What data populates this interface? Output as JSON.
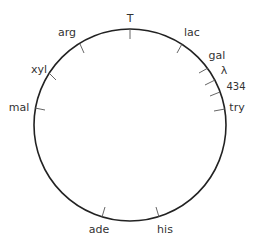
{
  "diagram": {
    "type": "circular-genetic-map",
    "center": [
      130,
      125
    ],
    "radius": 96,
    "stroke_color": "#222222",
    "markers": [
      {
        "label": "T",
        "angle_deg": 0,
        "tick_x1": 130,
        "tick_y1": 29,
        "tick_x2": 130,
        "tick_y2": 39,
        "label_x": 130,
        "label_y": 22
      },
      {
        "label": "lac",
        "angle_deg": 33,
        "tick_x1": 182,
        "tick_y1": 44,
        "tick_x2": 177,
        "tick_y2": 53,
        "label_x": 192,
        "label_y": 36
      },
      {
        "label": "gal",
        "angle_deg": 55,
        "tick_x1": 208,
        "tick_y1": 68,
        "tick_x2": 199,
        "tick_y2": 73,
        "label_x": 217,
        "label_y": 59
      },
      {
        "label": "λ",
        "angle_deg": 63,
        "tick_x1": 215,
        "tick_y1": 80,
        "tick_x2": 205,
        "tick_y2": 85,
        "label_x": 224,
        "label_y": 74
      },
      {
        "label": "434",
        "angle_deg": 70,
        "tick_x1": 220,
        "tick_y1": 92,
        "tick_x2": 210,
        "tick_y2": 96,
        "label_x": 236,
        "label_y": 90
      },
      {
        "label": "try",
        "angle_deg": 82,
        "tick_x1": 225,
        "tick_y1": 109,
        "tick_x2": 214,
        "tick_y2": 111,
        "label_x": 237,
        "label_y": 111
      },
      {
        "label": "his",
        "angle_deg": 163,
        "tick_x1": 159,
        "tick_y1": 217,
        "tick_x2": 156,
        "tick_y2": 207,
        "label_x": 165,
        "label_y": 233
      },
      {
        "label": "ade",
        "angle_deg": 197,
        "tick_x1": 102,
        "tick_y1": 217,
        "tick_x2": 105,
        "tick_y2": 207,
        "label_x": 99,
        "label_y": 233
      },
      {
        "label": "mal",
        "angle_deg": 277,
        "tick_x1": 35,
        "tick_y1": 108,
        "tick_x2": 45,
        "tick_y2": 110,
        "label_x": 19,
        "label_y": 111
      },
      {
        "label": "xyl",
        "angle_deg": 303,
        "tick_x1": 49,
        "tick_y1": 73,
        "tick_x2": 56,
        "tick_y2": 80,
        "label_x": 39,
        "label_y": 73
      },
      {
        "label": "arg",
        "angle_deg": 333,
        "tick_x1": 80,
        "tick_y1": 44,
        "tick_x2": 84,
        "tick_y2": 53,
        "label_x": 67,
        "label_y": 36
      }
    ]
  }
}
